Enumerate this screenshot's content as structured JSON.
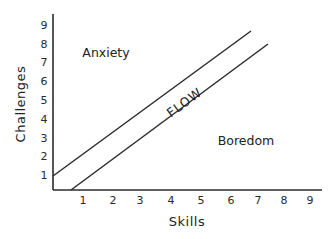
{
  "diagram": {
    "x_axis": {
      "label": "Skills",
      "ticks": [
        "1",
        "2",
        "3",
        "4",
        "5",
        "6",
        "7",
        "8",
        "9"
      ]
    },
    "y_axis": {
      "label": "Challenges",
      "ticks": [
        "1",
        "2",
        "3",
        "4",
        "5",
        "6",
        "7",
        "8",
        "9"
      ]
    },
    "regions": {
      "upper": "Anxiety",
      "channel": "FLOW",
      "lower": "Boredom"
    },
    "colors": {
      "line": "#2b2b2b",
      "text": "#222222",
      "background": "#ffffff"
    }
  }
}
